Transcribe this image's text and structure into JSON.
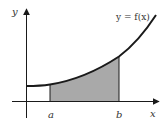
{
  "diagram": {
    "curve_label": "y = f(x)",
    "axis_labels": {
      "x": "x",
      "y": "y"
    },
    "bounds": {
      "lower": "a",
      "upper": "b"
    },
    "colors": {
      "shade": "#a9a9a9",
      "curve": "#1a1a1a",
      "axis": "#1a1a1a",
      "background": "#ffffff"
    }
  }
}
